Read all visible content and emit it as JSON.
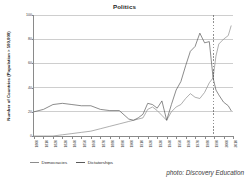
{
  "chart_data": {
    "type": "line",
    "title": "Politics",
    "xlabel": "",
    "ylabel": "Number of Countries (Population > 500,000)",
    "xlim": [
      1800,
      2010
    ],
    "ylim": [
      0,
      100
    ],
    "grid": true,
    "legend_position": "below-axis-left",
    "x_tick_labels": [
      "1800",
      "1810",
      "1820",
      "1830",
      "1840",
      "1850",
      "1860",
      "1870",
      "1880",
      "1890",
      "1900",
      "1910",
      "1920",
      "1930",
      "1940",
      "1950",
      "1960",
      "1970",
      "1980",
      "1990",
      "2000",
      "2010"
    ],
    "y_tick_labels": [
      "0",
      "20",
      "40",
      "60",
      "80",
      "100"
    ],
    "y_ticks": [
      0,
      20,
      40,
      60,
      80,
      100
    ],
    "annotations": [
      {
        "name": "crossover-reference-line",
        "type": "vertical-dashed-line",
        "x": 1989
      }
    ],
    "series": [
      {
        "name": "Democracies",
        "color": "#8c8c8c",
        "x": [
          1800,
          1810,
          1820,
          1830,
          1840,
          1850,
          1860,
          1870,
          1880,
          1890,
          1900,
          1905,
          1910,
          1915,
          1920,
          1925,
          1930,
          1935,
          1940,
          1945,
          1950,
          1955,
          1960,
          1965,
          1970,
          1975,
          1980,
          1985,
          1989,
          1992,
          1995,
          2000,
          2005,
          2008
        ],
        "values": [
          0,
          0,
          0,
          1,
          2,
          3,
          4,
          6,
          8,
          10,
          12,
          13,
          14,
          15,
          22,
          24,
          21,
          17,
          13,
          20,
          24,
          26,
          31,
          35,
          32,
          31,
          36,
          44,
          48,
          66,
          76,
          80,
          83,
          91
        ]
      },
      {
        "name": "Dictatorships",
        "color": "#5a5a5a",
        "x": [
          1800,
          1810,
          1820,
          1830,
          1840,
          1850,
          1860,
          1870,
          1880,
          1890,
          1900,
          1905,
          1910,
          1915,
          1920,
          1925,
          1930,
          1935,
          1940,
          1945,
          1950,
          1955,
          1960,
          1965,
          1970,
          1975,
          1980,
          1985,
          1989,
          1992,
          1995,
          2000,
          2005,
          2008
        ],
        "values": [
          20,
          22,
          26,
          27,
          26,
          25,
          25,
          22,
          21,
          21,
          14,
          13,
          15,
          18,
          27,
          26,
          23,
          29,
          13,
          26,
          38,
          45,
          58,
          70,
          74,
          85,
          77,
          78,
          48,
          38,
          34,
          28,
          25,
          21
        ]
      }
    ]
  },
  "legend": {
    "entries": [
      {
        "label": "Democracies"
      },
      {
        "label": "Dictatorships"
      }
    ]
  },
  "credit": {
    "text": "photo: Discovery Education"
  }
}
